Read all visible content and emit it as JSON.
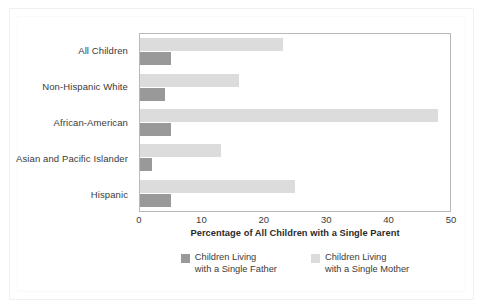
{
  "chart_data": {
    "type": "bar",
    "orientation": "horizontal",
    "title": "",
    "xlabel": "Percentage of All Children with a Single Parent",
    "ylabel": "",
    "xlim": [
      0,
      50
    ],
    "xticks": [
      0,
      10,
      20,
      30,
      40,
      50
    ],
    "grid": false,
    "legend_position": "bottom",
    "categories": [
      "All Children",
      "Non-Hispanic White",
      "African-American",
      "Asian and Pacific Islander",
      "Hispanic"
    ],
    "series": [
      {
        "name": "Children Living with a Single Mother",
        "name_line1": "Children Living",
        "name_line2": "with a Single Mother",
        "color": "#dcdcdc",
        "values": [
          23,
          16,
          48,
          13,
          25
        ]
      },
      {
        "name": "Children Living with a Single Father",
        "name_line1": "Children Living",
        "name_line2": "with a Single Father",
        "color": "#999999",
        "values": [
          5,
          4,
          5,
          2,
          5
        ]
      }
    ],
    "legend_order": [
      1,
      0
    ]
  },
  "colors": {
    "father_bar": "#999999",
    "mother_bar": "#dcdcdc",
    "plot_border": "#b9b9b9",
    "text": "#3a3a3a",
    "background": "#ffffff"
  }
}
